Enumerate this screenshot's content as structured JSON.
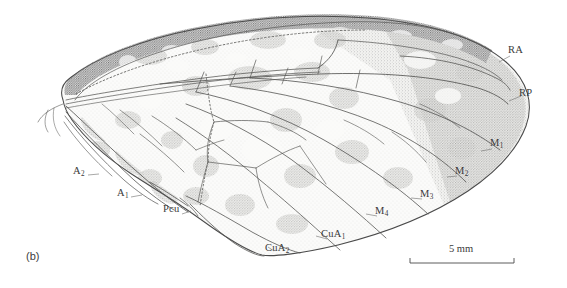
{
  "figure": {
    "caption": "(b)",
    "style": "stippled-line-drawing",
    "ink_color": "#4a4a4a",
    "membrane_light": "#f2f2f0",
    "membrane_mid": "#dcdcda",
    "membrane_dark": "#bdbdbb",
    "background": "#ffffff"
  },
  "scale_bar": {
    "label": "5 mm",
    "length_px": 106
  },
  "vein_labels": [
    {
      "id": "RA",
      "base": "RA",
      "sub": "",
      "x": 514,
      "y": 51,
      "leader": [
        [
          512,
          57
        ],
        [
          497,
          62
        ]
      ]
    },
    {
      "id": "RP",
      "base": "RP",
      "sub": "",
      "x": 524,
      "y": 94,
      "leader": [
        [
          522,
          99
        ],
        [
          508,
          101
        ]
      ]
    },
    {
      "id": "M1",
      "base": "M",
      "sub": "1",
      "x": 494,
      "y": 144,
      "leader": [
        [
          493,
          150
        ],
        [
          481,
          151
        ]
      ]
    },
    {
      "id": "M2",
      "base": "M",
      "sub": "2",
      "x": 459,
      "y": 172,
      "leader": [
        [
          458,
          178
        ],
        [
          447,
          177
        ]
      ]
    },
    {
      "id": "M3",
      "base": "M",
      "sub": "3",
      "x": 424,
      "y": 195,
      "leader": [
        [
          423,
          201
        ],
        [
          411,
          198
        ]
      ]
    },
    {
      "id": "M4",
      "base": "M",
      "sub": "4",
      "x": 379,
      "y": 212,
      "leader": [
        [
          378,
          218
        ],
        [
          366,
          214
        ]
      ]
    },
    {
      "id": "CuA1",
      "base": "CuA",
      "sub": "1",
      "x": 325,
      "y": 235,
      "leader": [
        [
          326,
          241
        ],
        [
          315,
          236
        ]
      ]
    },
    {
      "id": "CuA2",
      "base": "CuA",
      "sub": "2",
      "x": 269,
      "y": 249,
      "leader": [
        [
          272,
          254
        ],
        [
          266,
          248
        ]
      ]
    },
    {
      "id": "Pcu",
      "base": "Pcu",
      "sub": "",
      "x": 167,
      "y": 210,
      "leader": [
        [
          180,
          216
        ],
        [
          190,
          212
        ]
      ]
    },
    {
      "id": "A1",
      "base": "A",
      "sub": "1",
      "x": 121,
      "y": 194,
      "leader": [
        [
          128,
          199
        ],
        [
          140,
          196
        ]
      ]
    },
    {
      "id": "A2",
      "base": "A",
      "sub": "2",
      "x": 77,
      "y": 172,
      "leader": [
        [
          85,
          177
        ],
        [
          97,
          175
        ]
      ]
    }
  ]
}
